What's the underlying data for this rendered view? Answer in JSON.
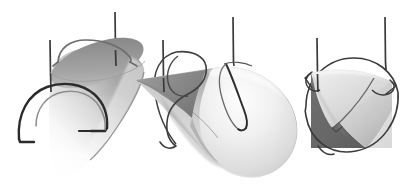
{
  "figure": {
    "kind": "geometric-illustration",
    "background_color": "#ffffff",
    "canvas": {
      "width": 416,
      "height": 193
    },
    "palette": {
      "background": "#ffffff",
      "line_dark": "#2b2b2b",
      "curve_dark": "#3a3a3a",
      "surface_light": "#f2f2f2",
      "surface_mid": "#c8c8c8",
      "surface_dark": "#6d6d6d",
      "surface_shadow": "#5f5f5f",
      "edge_gray": "#909090"
    },
    "panels": [
      {
        "id": "panel-left",
        "name": "cone-view-oblique",
        "label": "",
        "cone": {
          "orientation": "apex-down-left",
          "base_ellipse": {
            "cx": 96,
            "cy": 69,
            "rx": 50,
            "ry": 21,
            "rotation": -28
          },
          "apex": {
            "x": 57,
            "y": 176
          },
          "shading": "light-from-upper-right"
        },
        "vertical_lines": [
          {
            "x": 50,
            "y1": 40,
            "y2": 92
          },
          {
            "x": 115,
            "y1": 12,
            "y2": 66
          }
        ],
        "curves": [
          {
            "name": "front-arc",
            "style": "dark-thick",
            "description": "semicircular arc with short horizontal feet at both ends, crossing the cone front"
          },
          {
            "name": "top-arc",
            "style": "gray-medium",
            "description": "arc riding over the upper rim of the cone base"
          }
        ]
      },
      {
        "id": "panel-center",
        "name": "cone-view-lateral",
        "label": "",
        "cone": {
          "orientation": "apex-left-horizontal",
          "base_ellipse": {
            "cx": 255,
            "cy": 115,
            "rx": 45,
            "ry": 48,
            "rotation": 0
          },
          "apex": {
            "x": 140,
            "y": 80
          },
          "shading": "light-from-upper-right"
        },
        "vertical_lines": [
          {
            "x": 163,
            "y1": 40,
            "y2": 92
          },
          {
            "x": 233,
            "y1": 17,
            "y2": 66
          }
        ],
        "curves": [
          {
            "name": "left-loop",
            "style": "dark-thin",
            "description": "closed teardrop loop wrapping the narrow end of the cone"
          },
          {
            "name": "right-hook",
            "style": "dark-thin",
            "description": "hooked curve descending over the round face"
          }
        ]
      },
      {
        "id": "panel-right",
        "name": "cone-view-axial",
        "label": "",
        "cone": {
          "orientation": "apex-toward-viewer",
          "base_ellipse": {
            "cx": 352,
            "cy": 107,
            "rx": 46,
            "ry": 46,
            "rotation": 0
          },
          "apex": {
            "x": 330,
            "y": 95
          },
          "shading": "split-light-dark"
        },
        "vertical_lines": [
          {
            "x": 317,
            "y1": 38,
            "y2": 92
          },
          {
            "x": 385,
            "y1": 17,
            "y2": 70
          }
        ],
        "curves": [
          {
            "name": "circle-outline",
            "style": "dark-thin",
            "description": "near-circular curve encircling the cone"
          },
          {
            "name": "inner-kink",
            "style": "dark-thin",
            "description": "angular curve crossing near the apex"
          }
        ]
      }
    ]
  }
}
